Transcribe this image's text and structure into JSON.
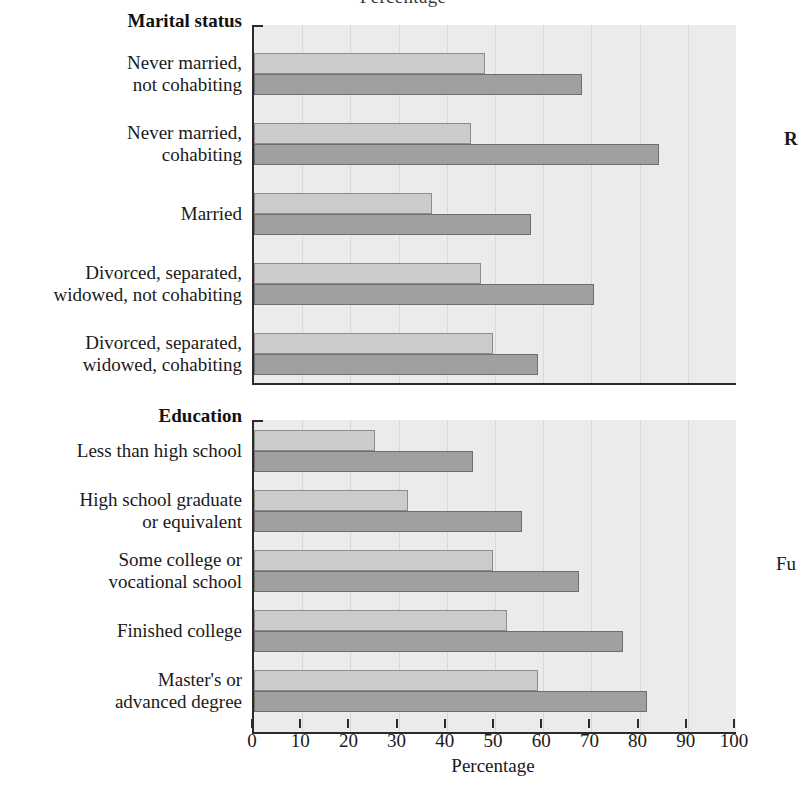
{
  "figure": {
    "top_title_partial": "Percentage",
    "axis_title": "Percentage",
    "right_margin_text": [
      {
        "id": "r",
        "text": "R",
        "bold": true
      },
      {
        "id": "fu",
        "text": "Fu",
        "bold": false
      }
    ]
  },
  "axis": {
    "ticks": [
      "0",
      "10",
      "20",
      "30",
      "40",
      "50",
      "60",
      "70",
      "80",
      "90",
      "100"
    ],
    "min": 0,
    "max": 100,
    "step": 10
  },
  "panels": [
    {
      "id": "marital",
      "heading": "Marital status",
      "categories": [
        "Never married,\nnot cohabiting",
        "Never married,\ncohabiting",
        "Married",
        "Divorced, separated,\nwidowed, not cohabiting",
        "Divorced, separated,\nwidowed, cohabiting"
      ]
    },
    {
      "id": "education",
      "heading": "Education",
      "categories": [
        "Less than high school",
        "High school graduate\nor equivalent",
        "Some college or\nvocational school",
        "Finished college",
        "Master's or\nadvanced degree"
      ]
    }
  ],
  "chart_data": [
    {
      "type": "bar",
      "orientation": "horizontal",
      "title": "Marital status",
      "xlabel": "Percentage",
      "ylabel": "",
      "xlim": [
        0,
        100
      ],
      "grid": true,
      "legend": "none",
      "categories": [
        "Never married, not cohabiting",
        "Never married, cohabiting",
        "Married",
        "Divorced, separated, widowed, not cohabiting",
        "Divorced, separated, widowed, cohabiting"
      ],
      "series": [
        {
          "name": "light",
          "values": [
            48,
            45,
            37,
            47,
            49.5
          ]
        },
        {
          "name": "dark",
          "values": [
            68,
            84,
            57.5,
            70.5,
            59
          ]
        }
      ]
    },
    {
      "type": "bar",
      "orientation": "horizontal",
      "title": "Education",
      "xlabel": "Percentage",
      "ylabel": "",
      "xlim": [
        0,
        100
      ],
      "grid": true,
      "legend": "none",
      "categories": [
        "Less than high school",
        "High school graduate or equivalent",
        "Some college or vocational school",
        "Finished college",
        "Master's or advanced degree"
      ],
      "series": [
        {
          "name": "light",
          "values": [
            25,
            32,
            49.5,
            52.5,
            59
          ]
        },
        {
          "name": "dark",
          "values": [
            45.5,
            55.5,
            67.5,
            76.5,
            81.5
          ]
        }
      ]
    }
  ]
}
